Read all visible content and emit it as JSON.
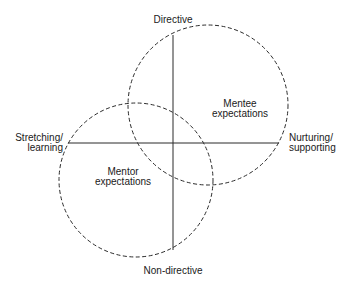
{
  "diagram": {
    "axes": {
      "top": "Directive",
      "bottom": "Non-directive",
      "left": [
        "Stretching/",
        "learning"
      ],
      "right": [
        "Nurturing/",
        "supporting"
      ]
    },
    "circles": [
      {
        "name": "Mentee expectations",
        "lines": [
          "Mentee",
          "expectations"
        ],
        "cx": 208,
        "cy": 105,
        "r": 80
      },
      {
        "name": "Mentor expectations",
        "lines": [
          "Mentor",
          "expectations"
        ],
        "cx": 136,
        "cy": 180,
        "r": 77
      }
    ],
    "colors": {
      "line": "#2a2a2a",
      "text": "#1a1a1a",
      "background": "#ffffff"
    }
  }
}
